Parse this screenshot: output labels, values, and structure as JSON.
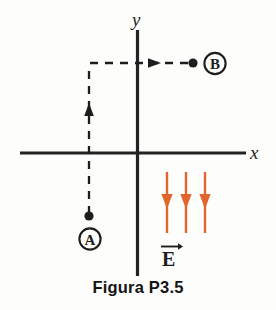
{
  "figure": {
    "caption": "Figura P3.5",
    "axes": {
      "x_label": "x",
      "y_label": "y",
      "axis_color": "#232323"
    },
    "points": [
      {
        "id": "A",
        "label": "A",
        "x": 89,
        "y": 216,
        "label_x": 90,
        "label_y": 239
      },
      {
        "id": "B",
        "label": "B",
        "x": 193,
        "y": 63,
        "label_x": 215,
        "label_y": 63
      }
    ],
    "path": {
      "description": "dashed trajectory from A upward then rightward to B",
      "dash_color": "#1d1d1d",
      "segments": [
        {
          "name": "vertical-segment",
          "from_x": 89,
          "from_y": 216,
          "to_x": 89,
          "to_y": 63,
          "arrow_direction": "up",
          "arrow_x": 89,
          "arrow_y": 110
        },
        {
          "name": "horizontal-segment",
          "from_x": 89,
          "from_y": 63,
          "to_x": 193,
          "to_y": 63,
          "arrow_direction": "right",
          "arrow_x": 155,
          "arrow_y": 63
        }
      ]
    },
    "field": {
      "symbol": "E",
      "vector_notation": true,
      "direction": "down",
      "color": "#E2652E",
      "arrow_count": 3,
      "arrow_x_positions": [
        167,
        186,
        205
      ],
      "arrow_top_y": 172,
      "arrow_bottom_y": 233,
      "arrow_head_y": 205,
      "label_x": 170,
      "label_y": 263
    }
  },
  "colors": {
    "background": "#fdfdfc",
    "ink": "#1d1d1d",
    "field_orange": "#E2652E"
  }
}
